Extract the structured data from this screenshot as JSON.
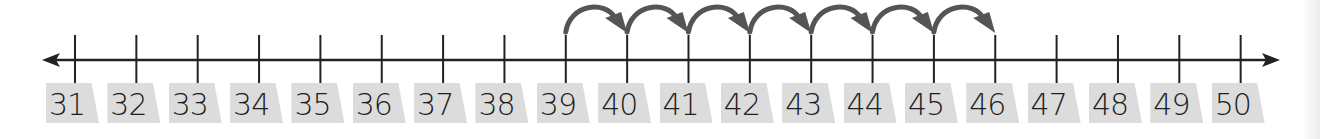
{
  "number_line": {
    "start": 31,
    "end": 50,
    "step": 1,
    "labels": [
      "31",
      "32",
      "33",
      "34",
      "35",
      "36",
      "37",
      "38",
      "39",
      "40",
      "41",
      "42",
      "43",
      "44",
      "45",
      "46",
      "47",
      "48",
      "49",
      "50"
    ],
    "arrows_both_ends": true
  },
  "jumps": {
    "from": 39,
    "to": 46,
    "count": 7,
    "size": 1,
    "direction": "right"
  },
  "colors": {
    "line": "#222222",
    "jump_arrow": "#555555",
    "label_box": "#dcdcdc",
    "label_text": "#1e1e1e"
  }
}
